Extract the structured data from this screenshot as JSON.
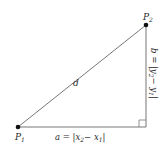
{
  "diagram": {
    "type": "right-triangle-distance",
    "points": {
      "p1": {
        "label": "P",
        "sub": "1",
        "x": 18,
        "y": 127
      },
      "p2": {
        "label": "P",
        "sub": "2",
        "x": 146,
        "y": 25
      }
    },
    "hypotenuse_label": "d",
    "horizontal_leg": {
      "prefix": "a = |x",
      "sub1": "2",
      "mid": "− x",
      "sub2": "1",
      "suffix": "|"
    },
    "vertical_leg": {
      "prefix": "b = |y",
      "sub1": "2",
      "mid": "− y",
      "sub2": "1",
      "suffix": "|"
    },
    "colors": {
      "line": "#777777",
      "point": "#111111",
      "text": "#2a2a2a"
    }
  }
}
